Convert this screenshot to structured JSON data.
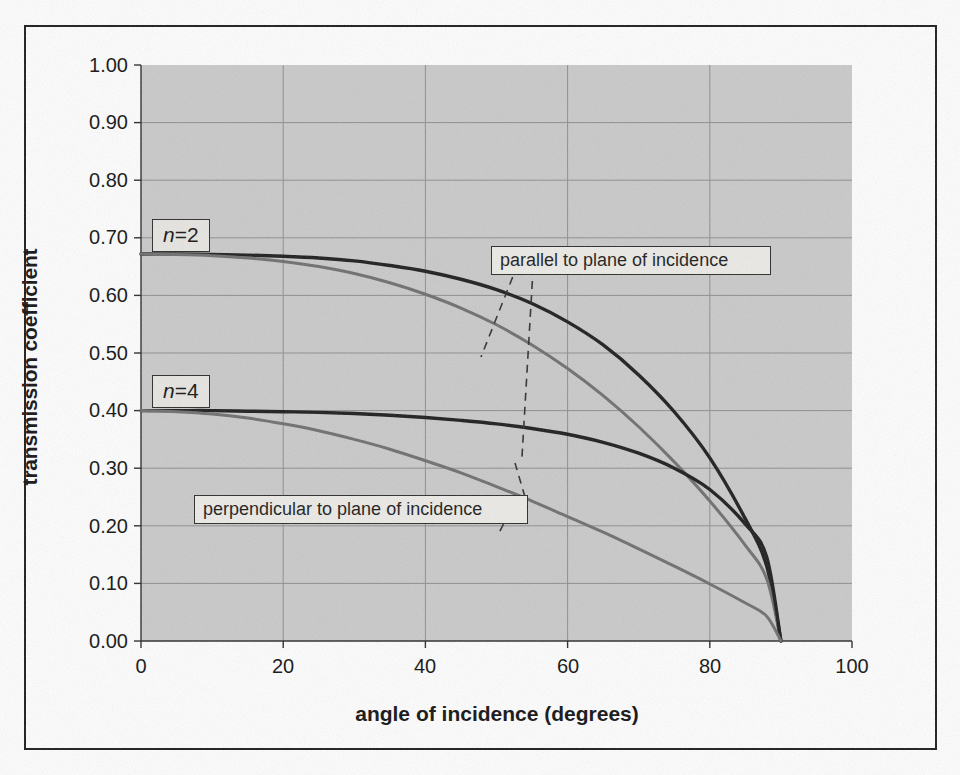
{
  "chart_data": {
    "type": "line",
    "title": "",
    "xlabel": "angle of incidence (degrees)",
    "ylabel": "transmission coefficient",
    "xlim": [
      0,
      100
    ],
    "ylim": [
      0,
      1.0
    ],
    "xticks": [
      "0",
      "20",
      "40",
      "60",
      "80",
      "100"
    ],
    "yticks": [
      "0.00",
      "0.10",
      "0.20",
      "0.30",
      "0.40",
      "0.50",
      "0.60",
      "0.70",
      "0.80",
      "0.90",
      "1.00"
    ],
    "grid": true,
    "legend": "none",
    "annotations": [
      {
        "id": "n2",
        "text": "n=2",
        "italic_part": "n",
        "rest": "=2"
      },
      {
        "id": "n4",
        "text": "n=4",
        "italic_part": "n",
        "rest": "=4"
      },
      {
        "id": "parallel",
        "text": "parallel to plane of incidence"
      },
      {
        "id": "perpendicular",
        "text": "perpendicular to plane of incidence"
      }
    ],
    "colors": {
      "parallel": "#1c1c1c",
      "perpendicular": "#6e6e6e",
      "plot_background": "#c9c9c9",
      "grid": "#8d8d8d",
      "frame": "#1b1b1b"
    },
    "x": [
      0,
      5,
      10,
      15,
      20,
      25,
      30,
      35,
      40,
      45,
      50,
      55,
      60,
      65,
      70,
      75,
      80,
      85,
      88,
      90
    ],
    "series": [
      {
        "name": "n=2 parallel to plane of incidence",
        "group": "n=2",
        "polarization": "parallel",
        "color": "#1c1c1c",
        "values": [
          0.672,
          0.672,
          0.671,
          0.67,
          0.668,
          0.665,
          0.66,
          0.652,
          0.642,
          0.628,
          0.61,
          0.586,
          0.554,
          0.514,
          0.462,
          0.398,
          0.318,
          0.212,
          0.13,
          0.0
        ]
      },
      {
        "name": "n=2 perpendicular to plane of incidence",
        "group": "n=2",
        "polarization": "perpendicular",
        "color": "#6e6e6e",
        "values": [
          0.672,
          0.671,
          0.669,
          0.665,
          0.659,
          0.65,
          0.638,
          0.622,
          0.602,
          0.578,
          0.549,
          0.514,
          0.473,
          0.426,
          0.372,
          0.311,
          0.243,
          0.166,
          0.108,
          0.0
        ]
      },
      {
        "name": "n=4 parallel to plane of incidence",
        "group": "n=4",
        "polarization": "parallel",
        "color": "#1c1c1c",
        "values": [
          0.4,
          0.4,
          0.4,
          0.399,
          0.398,
          0.397,
          0.395,
          0.392,
          0.388,
          0.383,
          0.377,
          0.369,
          0.359,
          0.345,
          0.326,
          0.3,
          0.263,
          0.203,
          0.146,
          0.0
        ]
      },
      {
        "name": "n=4 perpendicular to plane of incidence",
        "group": "n=4",
        "polarization": "perpendicular",
        "color": "#6e6e6e",
        "values": [
          0.4,
          0.398,
          0.394,
          0.387,
          0.377,
          0.365,
          0.35,
          0.333,
          0.313,
          0.292,
          0.268,
          0.243,
          0.216,
          0.189,
          0.16,
          0.13,
          0.099,
          0.066,
          0.043,
          0.0
        ]
      }
    ]
  }
}
